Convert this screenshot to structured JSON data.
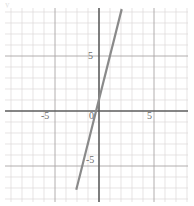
{
  "figure": {
    "name": "coordinate-plane-graph",
    "stray_mark": "y",
    "background_color": "#ffffff"
  },
  "axes": {
    "x_axis_label": "",
    "y_axis_label": "",
    "axis_color": "#5a5a5a",
    "grid_minor_color": "#d8d4d4",
    "grid_major_color": "#a9a6a6",
    "tick_labels": {
      "y_positive_5": "5",
      "origin": "0",
      "y_negative_5": "-5",
      "x_negative_5": "-5",
      "x_positive_5": "5"
    }
  },
  "chart_data": {
    "type": "line",
    "title": "",
    "xlabel": "",
    "ylabel": "",
    "xlim": [
      -8.5,
      8.0
    ],
    "ylim": [
      -8.2,
      9.4
    ],
    "xticks": [
      -5,
      0,
      5
    ],
    "yticks": [
      -5,
      0,
      5
    ],
    "tick_labels_x": [
      "-5",
      "0",
      "5"
    ],
    "tick_labels_y": [
      "-5",
      "0",
      "5"
    ],
    "grid": true,
    "grid_minor_step": 1,
    "grid_major_step": 5,
    "legend": false,
    "series": [
      {
        "name": "line",
        "type": "line",
        "color": "#8a8a8a",
        "slope": 4,
        "intercept": 1.2,
        "x": [
          -2.05,
          2.0
        ],
        "values": [
          -7.0,
          9.2
        ],
        "endpoints": [
          {
            "x": -2.05,
            "y": -7.0
          },
          {
            "x": 2.0,
            "y": 9.2
          }
        ],
        "x_intercept": -0.3,
        "y_intercept": 1.2
      }
    ]
  }
}
